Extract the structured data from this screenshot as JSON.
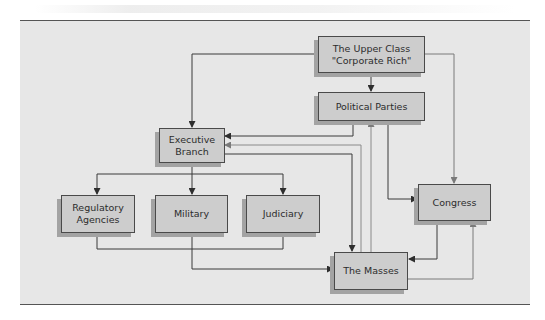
{
  "diagram": {
    "type": "flowchart",
    "nodes": [
      {
        "id": "upper_class",
        "label": "The Upper Class\n\"Corporate Rich\""
      },
      {
        "id": "political_parties",
        "label": "Political Parties"
      },
      {
        "id": "executive_branch",
        "label": "Executive\nBranch"
      },
      {
        "id": "regulatory_agencies",
        "label": "Regulatory\nAgencies"
      },
      {
        "id": "military",
        "label": "Military"
      },
      {
        "id": "judiciary",
        "label": "Judiciary"
      },
      {
        "id": "congress",
        "label": "Congress"
      },
      {
        "id": "masses",
        "label": "The Masses"
      }
    ],
    "edges": [
      {
        "from": "upper_class",
        "to": "political_parties"
      },
      {
        "from": "upper_class",
        "to": "executive_branch"
      },
      {
        "from": "upper_class",
        "to": "congress"
      },
      {
        "from": "political_parties",
        "to": "executive_branch"
      },
      {
        "from": "political_parties",
        "to": "congress"
      },
      {
        "from": "masses",
        "to": "executive_branch"
      },
      {
        "from": "masses",
        "to": "political_parties"
      },
      {
        "from": "executive_branch",
        "to": "masses"
      },
      {
        "from": "executive_branch",
        "to": "regulatory_agencies"
      },
      {
        "from": "executive_branch",
        "to": "military"
      },
      {
        "from": "executive_branch",
        "to": "judiciary"
      },
      {
        "from": "military",
        "to": "masses"
      },
      {
        "from": "regulatory_agencies",
        "to": "masses"
      },
      {
        "from": "judiciary",
        "to": "masses"
      },
      {
        "from": "congress",
        "to": "masses"
      },
      {
        "from": "masses",
        "to": "congress"
      }
    ]
  },
  "colors": {
    "panel_background": "#e7e7e7",
    "box_fill": "#cdcdcd",
    "box_border": "#4a4a4a",
    "box_shadow": "#a3a3a3",
    "dark_line": "#3a3a3a",
    "light_line": "#8a8a8a"
  }
}
